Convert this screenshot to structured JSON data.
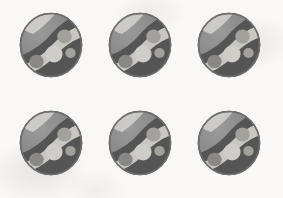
{
  "scene": {
    "title": "Decorative patterned spheres",
    "background_color": "#f9f8f7",
    "width": 283,
    "height": 198,
    "item_count": 6,
    "rows": 2,
    "columns": 3
  },
  "palette": {
    "background": "#f9f8f7",
    "outline": "#6e6e6e",
    "sphere_base": "#8d8d8d",
    "sphere_shadow": "#7b7b7b",
    "dark_band": "#555555",
    "dark_band_deep": "#4a4a4a",
    "light_band": "#c9c7c2",
    "light_band_bright": "#d8d6d1",
    "dot_light": "#cfcdc8",
    "dot_mid": "#a3a19c",
    "dot_dark": "#8a8884",
    "highlight": "#dedcd7",
    "rim_shadow": "#6a6a6a"
  },
  "marbles": [
    {
      "id": "marble-1",
      "label": "Marble 1",
      "row": 1,
      "column": 1,
      "x": 19,
      "y": 12
    },
    {
      "id": "marble-2",
      "label": "Marble 2",
      "row": 1,
      "column": 2,
      "x": 108,
      "y": 12
    },
    {
      "id": "marble-3",
      "label": "Marble 3",
      "row": 1,
      "column": 3,
      "x": 197,
      "y": 12
    },
    {
      "id": "marble-4",
      "label": "Marble 4",
      "row": 2,
      "column": 1,
      "x": 19,
      "y": 110
    },
    {
      "id": "marble-5",
      "label": "Marble 5",
      "row": 2,
      "column": 2,
      "x": 108,
      "y": 110
    },
    {
      "id": "marble-6",
      "label": "Marble 6",
      "row": 2,
      "column": 3,
      "x": 197,
      "y": 110
    }
  ],
  "marble_design": {
    "shape": "sphere",
    "diameter": 64,
    "features": [
      "light diagonal band across upper body",
      "dark crescent band on lower body",
      "light circular dots on dark band",
      "soft highlight at upper left",
      "shaded rim at lower right"
    ],
    "dots": [
      {
        "name": "dot-upper-right",
        "cx": 45.5,
        "cy": 24.5,
        "r": 7.0,
        "tone": "dot-mid"
      },
      {
        "name": "dot-center",
        "cx": 35.0,
        "cy": 42.0,
        "r": 8.5,
        "tone": "dot-light"
      },
      {
        "name": "dot-lower-left",
        "cx": 17.5,
        "cy": 49.5,
        "r": 7.0,
        "tone": "dot-dark"
      },
      {
        "name": "dot-right-lower",
        "cx": 51.0,
        "cy": 41.0,
        "r": 5.0,
        "tone": "dot-mid"
      }
    ]
  }
}
